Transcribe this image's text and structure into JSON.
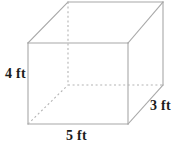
{
  "figure": {
    "name": "rectangular-prism",
    "shape_type": "rectangular prism",
    "units": "ft",
    "stroke_color": "#a8a8a8",
    "hidden_stroke_color": "#b4b4b4",
    "background_color": "#ffffff",
    "text_color": "#1b1b1b",
    "labels": {
      "height": "4 ft",
      "width": "5 ft",
      "depth": "3 ft"
    },
    "dimensions": {
      "height_value": 4,
      "width_value": 5,
      "depth_value": 3
    },
    "geometry": {
      "front_face": {
        "top_left": [
          28,
          43
        ],
        "top_right": [
          128,
          43
        ],
        "bottom_right": [
          128,
          124
        ],
        "bottom_left": [
          28,
          124
        ]
      },
      "back_face": {
        "top_left": [
          68,
          2
        ],
        "top_right": [
          163,
          2
        ],
        "bottom_right": [
          163,
          85
        ],
        "bottom_left": [
          68,
          85
        ]
      },
      "hidden_edges": [
        {
          "name": "back-vertical-left",
          "from": [
            68,
            2
          ],
          "to": [
            68,
            85
          ]
        },
        {
          "name": "back-bottom-horizontal",
          "from": [
            68,
            85
          ],
          "to": [
            163,
            85
          ]
        },
        {
          "name": "bottom-left-diagonal",
          "from": [
            28,
            124
          ],
          "to": [
            68,
            85
          ]
        }
      ]
    }
  }
}
